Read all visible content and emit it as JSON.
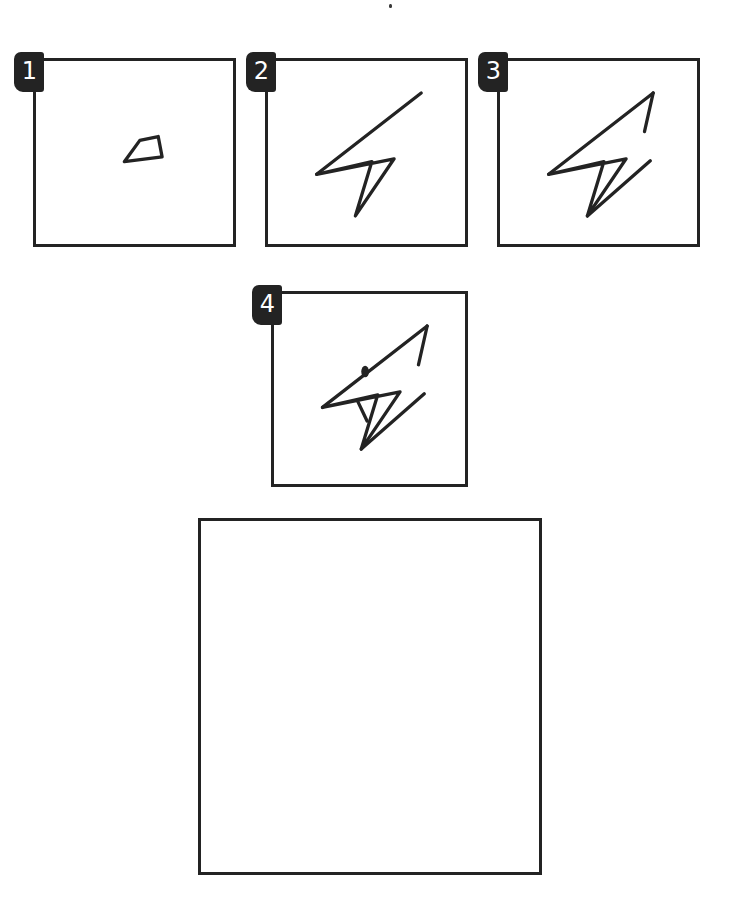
{
  "document": {
    "kind": "step-by-step-drawing-worksheet",
    "subject": "lightning-bolt-bird-head",
    "background_color": "#ffffff",
    "ink_color": "#232323",
    "width": 752,
    "height": 909
  },
  "marks": [
    {
      "name": "stray-speck",
      "x": 389,
      "y": 4
    }
  ],
  "steps": [
    {
      "number": "1",
      "label": "Step 1",
      "box": {
        "x": 33,
        "y": 58,
        "w": 203,
        "h": 189
      },
      "description": "A narrow elongated quadrilateral sloping up to the right.",
      "strokes": [
        {
          "name": "beak-outline",
          "d": "M 91 104 L 130 99 L 126 78 L 107 82 Z"
        }
      ]
    },
    {
      "number": "2",
      "label": "Step 2",
      "box": {
        "x": 265,
        "y": 58,
        "w": 203,
        "h": 189
      },
      "description": "Add a long upward diagonal and a downward pointed tail to form the bolt.",
      "strokes": [
        {
          "name": "upper-diagonal",
          "d": "M 50 117 L 158 33"
        },
        {
          "name": "lower-wedge",
          "d": "M 50 117 L 130 101 L 90 160 L 107 104 Z"
        }
      ]
    },
    {
      "number": "3",
      "label": "Step 3",
      "box": {
        "x": 497,
        "y": 58,
        "w": 203,
        "h": 189
      },
      "description": "Close the top point into an arrow head and add the lower right wing line.",
      "strokes": [
        {
          "name": "upper-diagonal",
          "d": "M 50 117 L 158 33"
        },
        {
          "name": "arrow-head-return",
          "d": "M 158 33 L 149 73"
        },
        {
          "name": "lower-wedge",
          "d": "M 50 117 L 130 101 L 90 160 L 107 104 Z"
        },
        {
          "name": "lower-wing",
          "d": "M 90 160 L 155 103"
        }
      ]
    },
    {
      "number": "4",
      "label": "Step 4",
      "box": {
        "x": 271,
        "y": 291,
        "w": 197,
        "h": 196
      },
      "description": "Add the eye dot and an inner crease line to finish the bird head.",
      "strokes": [
        {
          "name": "upper-diagonal",
          "d": "M 50 117 L 158 33"
        },
        {
          "name": "arrow-head-return",
          "d": "M 158 33 L 149 73"
        },
        {
          "name": "lower-wedge",
          "d": "M 50 117 L 130 101 L 90 160 L 107 104 Z"
        },
        {
          "name": "lower-wing",
          "d": "M 90 160 L 155 103"
        },
        {
          "name": "inner-crease",
          "d": "M 86 110 L 96 131"
        }
      ],
      "eye": {
        "name": "eye-dot",
        "cx": 94,
        "cy": 80,
        "rx": 4,
        "ry": 6
      }
    }
  ],
  "practice_area": {
    "name": "practice-box",
    "label": "Practice area",
    "box": {
      "x": 198,
      "y": 518,
      "w": 344,
      "h": 357
    },
    "content": ""
  }
}
